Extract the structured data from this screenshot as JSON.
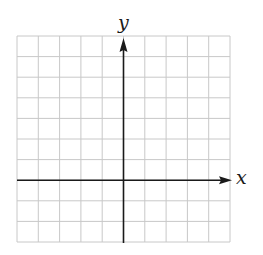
{
  "diagram": {
    "type": "coordinate-grid",
    "grid": {
      "columns": 10,
      "rows": 10,
      "origin_column": 5,
      "origin_row_from_top": 7,
      "line_color": "#c8c8c8",
      "axis_color": "#1a1a1a"
    },
    "axes": {
      "x_label": "x",
      "y_label": "y"
    }
  }
}
